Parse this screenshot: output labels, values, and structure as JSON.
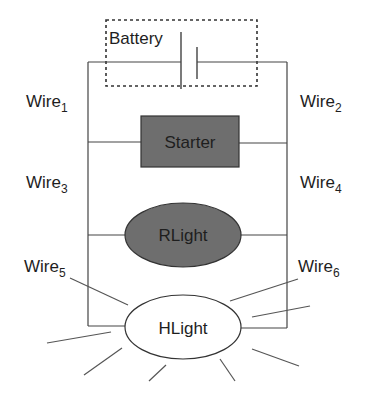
{
  "diagram": {
    "type": "circuit",
    "battery": {
      "label": "Battery"
    },
    "components": [
      {
        "id": "starter",
        "label": "Starter",
        "shape": "rectangle",
        "fill": "#6e6e6e"
      },
      {
        "id": "rlight",
        "label": "RLight",
        "shape": "ellipse",
        "fill": "#6e6e6e"
      },
      {
        "id": "hlight",
        "label": "HLight",
        "shape": "ellipse",
        "fill": "#ffffff"
      }
    ],
    "wires": [
      {
        "base": "Wire",
        "sub": "1"
      },
      {
        "base": "Wire",
        "sub": "2"
      },
      {
        "base": "Wire",
        "sub": "3"
      },
      {
        "base": "Wire",
        "sub": "4"
      },
      {
        "base": "Wire",
        "sub": "5"
      },
      {
        "base": "Wire",
        "sub": "6"
      }
    ],
    "colors": {
      "line": "#444444",
      "component_fill": "#6e6e6e",
      "background": "#ffffff"
    }
  }
}
